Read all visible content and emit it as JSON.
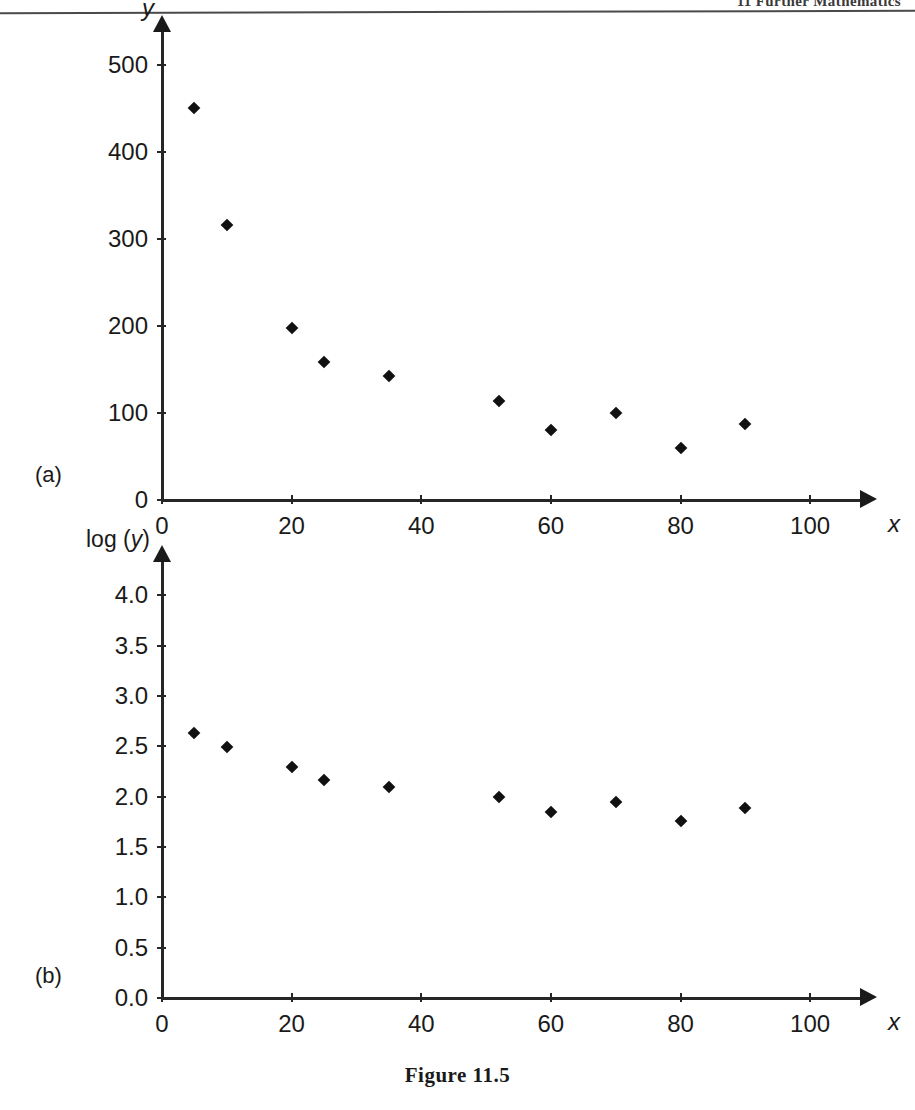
{
  "header": {
    "running_head": "11 Further Mathematics"
  },
  "caption": {
    "text": "Figure 11.5"
  },
  "panels": [
    {
      "tag": "(a)"
    },
    {
      "tag": "(b)"
    }
  ],
  "chart_data": [
    {
      "type": "scatter",
      "panel": "(a)",
      "title": "",
      "xlabel": "x",
      "ylabel": "y",
      "xlim": [
        0,
        108
      ],
      "ylim": [
        0,
        540
      ],
      "xticks": [
        0,
        20,
        40,
        60,
        80,
        100
      ],
      "xticklabels": [
        "0",
        "20",
        "40",
        "60",
        "80",
        "100"
      ],
      "yticks": [
        0,
        100,
        200,
        300,
        400,
        500
      ],
      "yticklabels": [
        "0",
        "100",
        "200",
        "300",
        "400",
        "500"
      ],
      "grid": false,
      "legend": false,
      "marker": "diamond",
      "marker_color": "#111111",
      "x": [
        5,
        10,
        20,
        25,
        35,
        52,
        60,
        70,
        80,
        90
      ],
      "y": [
        450,
        316,
        198,
        158,
        142,
        114,
        80,
        100,
        60,
        87
      ]
    },
    {
      "type": "scatter",
      "panel": "(b)",
      "title": "",
      "xlabel": "x",
      "ylabel": "log (y)",
      "xlim": [
        0,
        108
      ],
      "ylim": [
        0.0,
        4.35
      ],
      "xticks": [
        0,
        20,
        40,
        60,
        80,
        100
      ],
      "xticklabels": [
        "0",
        "20",
        "40",
        "60",
        "80",
        "100"
      ],
      "yticks": [
        0.0,
        0.5,
        1.0,
        1.5,
        2.0,
        2.5,
        3.0,
        3.5,
        4.0
      ],
      "yticklabels": [
        "0.0",
        "0.5",
        "1.0",
        "1.5",
        "2.0",
        "2.5",
        "3.0",
        "3.5",
        "4.0"
      ],
      "grid": false,
      "legend": false,
      "marker": "diamond",
      "marker_color": "#111111",
      "x": [
        5,
        10,
        20,
        25,
        35,
        52,
        60,
        70,
        80,
        90
      ],
      "y": [
        2.63,
        2.49,
        2.29,
        2.17,
        2.1,
        2.0,
        1.85,
        1.95,
        1.76,
        1.89
      ]
    }
  ]
}
